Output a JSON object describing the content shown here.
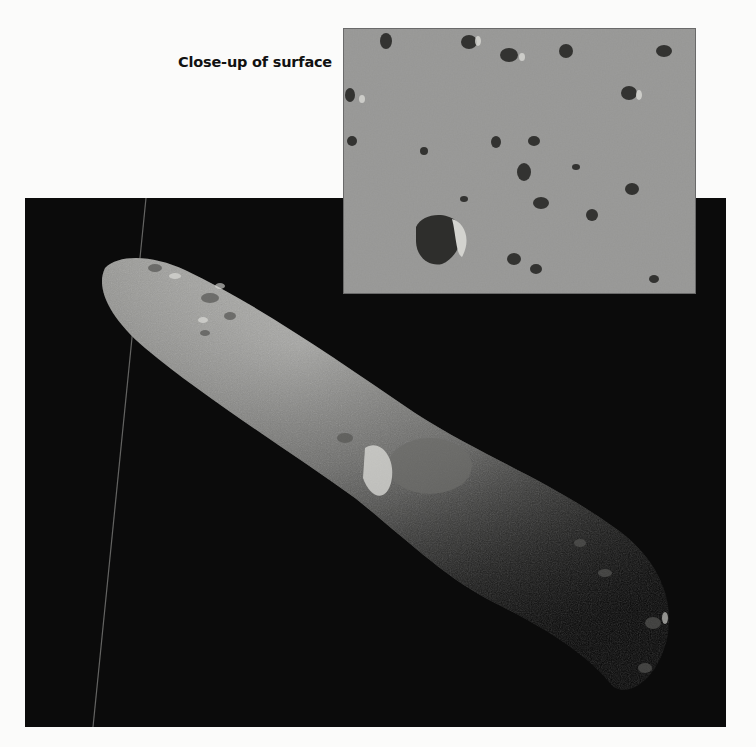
{
  "figure": {
    "inset_caption": "Close-up of surface",
    "main_image": {
      "subject": "elongated asteroid against black space",
      "background_color": "#0b0b0b",
      "surface_color": "#9a9a98"
    },
    "inset_image": {
      "subject": "close-up of rocky asteroid surface with scattered boulders",
      "surface_color": "#8e8e8c"
    }
  }
}
